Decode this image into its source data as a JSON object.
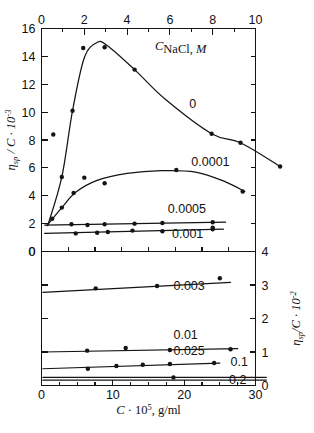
{
  "figure": {
    "title": "",
    "background_color": "#ffffff",
    "ink_color": "#141414"
  },
  "legend": {
    "title_symbol": "C",
    "title_sub": "NaCl",
    "title_unit": ", M"
  },
  "axes": {
    "top": {
      "label": "",
      "ticks": [
        "0",
        "2",
        "4",
        "6",
        "8",
        "10"
      ],
      "values": [
        0,
        2,
        4,
        6,
        8,
        10
      ],
      "range": [
        0,
        10
      ],
      "minor_step": 1
    },
    "bottom": {
      "label_main": "C",
      "label_exp_base": " · 10",
      "label_exp": "5",
      "label_unit": ", g/ml",
      "ticks": [
        "0",
        "10",
        "20",
        "30"
      ],
      "values": [
        0,
        10,
        20,
        30
      ],
      "range": [
        0,
        30
      ],
      "minor_step": 2.5
    },
    "left": {
      "label_eta": "η",
      "label_sub": "sp",
      "label_mid": " / C · 10",
      "label_exp": "-3",
      "ticks": [
        "0",
        "2",
        "4",
        "6",
        "8",
        "10",
        "12",
        "14",
        "16"
      ],
      "values": [
        0,
        2,
        4,
        6,
        8,
        10,
        12,
        14,
        16
      ],
      "range": [
        0,
        16
      ]
    },
    "right": {
      "label_eta": "η",
      "label_sub": "sp",
      "label_mid": "/C · 10",
      "label_exp": "-2",
      "ticks": [
        "0",
        "1",
        "2",
        "3",
        "4"
      ],
      "values": [
        0,
        1,
        2,
        3,
        4
      ],
      "range": [
        0,
        4
      ]
    }
  },
  "chart_data": {
    "type": "line",
    "title": "",
    "subtitle": "",
    "xlabel": "C · 10^5, g/ml",
    "ylabel": "ηsp / C",
    "grid": false,
    "legend_position": "inline-annotations",
    "panels": [
      {
        "name": "upper-panel",
        "xlabel": "C · 10^5, g/ml (top axis scale 0-10)",
        "ylabel": "ηsp / C · 10^-3",
        "xlim": [
          0,
          10
        ],
        "ylim": [
          0,
          16
        ],
        "x_axis_position": "top",
        "series": [
          {
            "name": "0",
            "label": "0",
            "label_x": 6.9,
            "label_y": 10.3,
            "points": [
              {
                "x": 0.55,
                "y": 8.4
              },
              {
                "x": 0.95,
                "y": 5.35
              },
              {
                "x": 1.45,
                "y": 10.1
              },
              {
                "x": 1.95,
                "y": 14.6
              },
              {
                "x": 2.95,
                "y": 14.65
              },
              {
                "x": 4.35,
                "y": 13.05
              },
              {
                "x": 7.95,
                "y": 8.45
              },
              {
                "x": 9.3,
                "y": 7.8
              },
              {
                "x": 11.15,
                "y": 6.1
              }
            ],
            "curve": [
              {
                "x": 0.3,
                "y": 1.9
              },
              {
                "x": 0.95,
                "y": 5.35
              },
              {
                "x": 1.45,
                "y": 10.1
              },
              {
                "x": 2.0,
                "y": 13.9
              },
              {
                "x": 2.6,
                "y": 15.0
              },
              {
                "x": 3.1,
                "y": 14.75
              },
              {
                "x": 4.35,
                "y": 13.05
              },
              {
                "x": 5.8,
                "y": 10.9
              },
              {
                "x": 7.95,
                "y": 8.45
              },
              {
                "x": 9.3,
                "y": 7.8
              },
              {
                "x": 11.15,
                "y": 6.1
              }
            ]
          },
          {
            "name": "0.0001",
            "label": "0.0001",
            "label_x": 7.0,
            "label_y": 6.15,
            "points": [
              {
                "x": 0.5,
                "y": 2.35
              },
              {
                "x": 0.95,
                "y": 3.15
              },
              {
                "x": 1.5,
                "y": 4.2
              },
              {
                "x": 2.0,
                "y": 5.3
              },
              {
                "x": 2.95,
                "y": 4.9
              },
              {
                "x": 6.3,
                "y": 5.85
              },
              {
                "x": 9.4,
                "y": 4.3
              }
            ],
            "curve": [
              {
                "x": 0.25,
                "y": 1.85
              },
              {
                "x": 0.95,
                "y": 3.15
              },
              {
                "x": 1.6,
                "y": 4.25
              },
              {
                "x": 2.6,
                "y": 5.1
              },
              {
                "x": 4.0,
                "y": 5.6
              },
              {
                "x": 5.6,
                "y": 5.8
              },
              {
                "x": 7.2,
                "y": 5.7
              },
              {
                "x": 8.6,
                "y": 5.0
              },
              {
                "x": 9.5,
                "y": 4.3
              }
            ]
          },
          {
            "name": "0.0005",
            "label": "0.0005",
            "label_x": 5.9,
            "label_y": 2.75,
            "points": [
              {
                "x": 1.4,
                "y": 1.95
              },
              {
                "x": 2.15,
                "y": 1.9
              },
              {
                "x": 2.95,
                "y": 1.95
              },
              {
                "x": 4.35,
                "y": 2.0
              },
              {
                "x": 5.65,
                "y": 2.05
              },
              {
                "x": 8.0,
                "y": 2.1
              },
              {
                "x": 8.0,
                "y": 1.7
              }
            ],
            "curve": [
              {
                "x": 0.15,
                "y": 1.9
              },
              {
                "x": 8.6,
                "y": 2.1
              }
            ]
          },
          {
            "name": "0.001",
            "label": "0.001",
            "label_x": 6.1,
            "label_y": 0.95,
            "points": [
              {
                "x": 1.6,
                "y": 1.3
              },
              {
                "x": 2.6,
                "y": 1.35
              },
              {
                "x": 3.1,
                "y": 1.4
              },
              {
                "x": 4.25,
                "y": 1.5
              },
              {
                "x": 5.65,
                "y": 1.45
              },
              {
                "x": 8.0,
                "y": 1.6
              }
            ],
            "curve": [
              {
                "x": 0.15,
                "y": 1.3
              },
              {
                "x": 8.5,
                "y": 1.6
              }
            ]
          }
        ]
      },
      {
        "name": "lower-panel",
        "xlabel": "C · 10^5, g/ml",
        "ylabel": "ηsp / C · 10^-2",
        "xlim": [
          0,
          30
        ],
        "ylim": [
          0,
          4
        ],
        "x_axis_position": "bottom",
        "series": [
          {
            "name": "0.003",
            "label": "0.003",
            "label_x": 18.5,
            "label_y": 2.78,
            "points": [
              {
                "x": 7.6,
                "y": 2.9
              },
              {
                "x": 16.2,
                "y": 2.97
              },
              {
                "x": 25.0,
                "y": 3.2
              }
            ],
            "curve": [
              {
                "x": 0.2,
                "y": 2.78
              },
              {
                "x": 26.5,
                "y": 3.08
              }
            ]
          },
          {
            "name": "0.01",
            "label": "0.01",
            "label_x": 18.5,
            "label_y": 1.32,
            "points": [
              {
                "x": 6.4,
                "y": 1.04
              },
              {
                "x": 11.8,
                "y": 1.12
              },
              {
                "x": 18.0,
                "y": 1.06
              },
              {
                "x": 26.5,
                "y": 1.08
              }
            ],
            "curve": [
              {
                "x": 0.2,
                "y": 1.0
              },
              {
                "x": 27.5,
                "y": 1.1
              }
            ]
          },
          {
            "name": "0.025",
            "label": "0.025",
            "label_x": 18.5,
            "label_y": 0.85,
            "points": [
              {
                "x": 6.5,
                "y": 0.5
              },
              {
                "x": 10.5,
                "y": 0.58
              },
              {
                "x": 14.2,
                "y": 0.62
              },
              {
                "x": 18.0,
                "y": 0.64
              },
              {
                "x": 24.2,
                "y": 0.67
              }
            ],
            "curve": [
              {
                "x": 0.2,
                "y": 0.5
              },
              {
                "x": 25.0,
                "y": 0.67
              }
            ]
          },
          {
            "name": "0.1",
            "label": "0.1",
            "label_x": 26.5,
            "label_y": 0.52,
            "points": [
              {
                "x": 18.5,
                "y": 0.24
              }
            ],
            "curve": [
              {
                "x": 0.2,
                "y": 0.24
              },
              {
                "x": 31.5,
                "y": 0.24
              }
            ]
          },
          {
            "name": "0.2",
            "label": "0.2",
            "label_x": 26.3,
            "label_y": 0.0,
            "points": [],
            "curve": [
              {
                "x": 0.2,
                "y": 0.16
              },
              {
                "x": 31.5,
                "y": 0.16
              }
            ]
          }
        ]
      }
    ]
  }
}
